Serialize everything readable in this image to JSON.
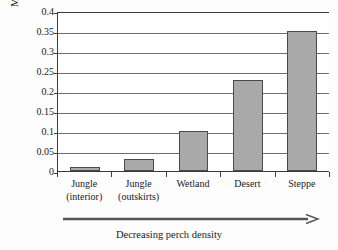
{
  "chart_data": {
    "type": "bar",
    "title": "",
    "xlabel": "Decreasing perch density",
    "ylabel": "Mean color change",
    "categories": [
      "Jungle (interior)",
      "Jungle (outskirts)",
      "Wetland",
      "Desert",
      "Steppe"
    ],
    "category_lines": [
      [
        "Jungle",
        "(interior)"
      ],
      [
        "Jungle",
        "(outskirts)"
      ],
      [
        "Wetland",
        ""
      ],
      [
        "Desert",
        ""
      ],
      [
        "Steppe",
        ""
      ]
    ],
    "values": [
      0.01,
      0.03,
      0.1,
      0.228,
      0.35
    ],
    "ylim": [
      0,
      0.4
    ],
    "yticks": [
      0,
      0.05,
      0.1,
      0.15,
      0.2,
      0.25,
      0.3,
      0.35,
      0.4
    ],
    "ytick_labels": [
      "0",
      "0.05",
      "0.1",
      "0.15",
      "0.2",
      "0.25",
      "0.3",
      "0.35",
      "0.4"
    ],
    "grid": true,
    "legend": false,
    "legend_position": "none",
    "bar_color": "#a9a9a9",
    "bar_border_color": "#4a4a4a",
    "axis_color": "#3a3a3a",
    "grid_color": "#6e6e6e",
    "background_color": "#fdfdfd"
  },
  "annotation": {
    "arrow_label": "Decreasing perch density",
    "arrow_direction": "right"
  }
}
